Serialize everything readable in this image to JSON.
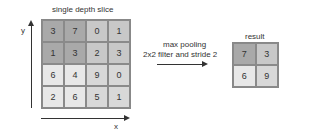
{
  "input": {
    "title": "single depth slice",
    "y_axis_label": "y",
    "x_axis_label": "x",
    "matrix": [
      [
        "3",
        "7",
        "0",
        "1"
      ],
      [
        "1",
        "3",
        "2",
        "3"
      ],
      [
        "6",
        "4",
        "9",
        "0"
      ],
      [
        "2",
        "6",
        "5",
        "1"
      ]
    ],
    "shades": [
      [
        "dark",
        "dark",
        "mid",
        "mid"
      ],
      [
        "dark",
        "dark",
        "mid",
        "mid"
      ],
      [
        "light",
        "light",
        "pale",
        "pale"
      ],
      [
        "light",
        "light",
        "pale",
        "pale"
      ]
    ]
  },
  "operation": {
    "line1": "max pooling",
    "line2": "2x2 filter and stride 2"
  },
  "output": {
    "title": "result",
    "matrix": [
      [
        "7",
        "3"
      ],
      [
        "6",
        "9"
      ]
    ],
    "shades": [
      [
        "dark",
        "mid"
      ],
      [
        "light",
        "pale"
      ]
    ]
  },
  "colors": {
    "dark": "#a9a9a9",
    "mid": "#c8c8c8",
    "light": "#e8e8e8",
    "pale": "#d8d8d8"
  }
}
